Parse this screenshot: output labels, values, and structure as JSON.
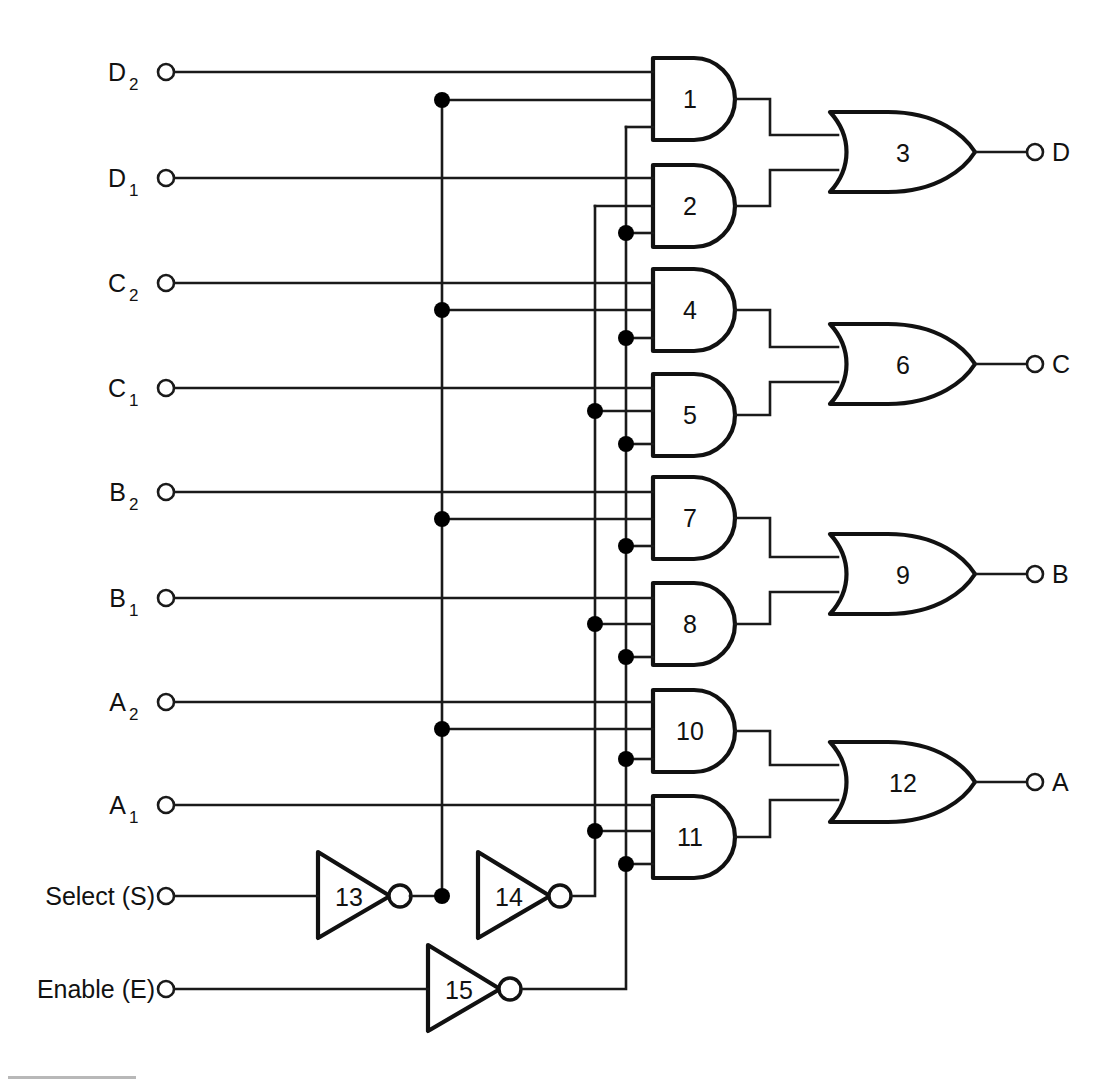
{
  "diagram": {
    "background_color": "#ffffff",
    "line_color": "#1a1a1a"
  },
  "inputs": [
    {
      "name": "input-d2",
      "base": "D",
      "sub": "2",
      "x": 165,
      "y": 72
    },
    {
      "name": "input-d1",
      "base": "D",
      "sub": "1",
      "x": 165,
      "y": 178
    },
    {
      "name": "input-c2",
      "base": "C",
      "sub": "2",
      "x": 165,
      "y": 283
    },
    {
      "name": "input-c1",
      "base": "C",
      "sub": "1",
      "x": 165,
      "y": 388
    },
    {
      "name": "input-b2",
      "base": "B",
      "sub": "2",
      "x": 165,
      "y": 492
    },
    {
      "name": "input-b1",
      "base": "B",
      "sub": "1",
      "x": 165,
      "y": 598
    },
    {
      "name": "input-a2",
      "base": "A",
      "sub": "2",
      "x": 165,
      "y": 702
    },
    {
      "name": "input-a1",
      "base": "A",
      "sub": "1",
      "x": 165,
      "y": 805
    }
  ],
  "control_inputs": [
    {
      "name": "input-select",
      "label": "Select (S)",
      "x": 165,
      "y": 896
    },
    {
      "name": "input-enable",
      "label": "Enable (E)",
      "x": 165,
      "y": 989
    }
  ],
  "outputs": [
    {
      "name": "output-d",
      "label": "D",
      "x": 1036,
      "y": 152
    },
    {
      "name": "output-c",
      "label": "C",
      "x": 1036,
      "y": 364
    },
    {
      "name": "output-b",
      "label": "B",
      "x": 1036,
      "y": 574
    },
    {
      "name": "output-a",
      "label": "A",
      "x": 1036,
      "y": 782
    }
  ],
  "and_gates": [
    {
      "name": "and-gate-1",
      "num": "1",
      "x": 653,
      "y": 58,
      "w": 82,
      "h": 82
    },
    {
      "name": "and-gate-2",
      "num": "2",
      "x": 653,
      "y": 165,
      "w": 82,
      "h": 82
    },
    {
      "name": "and-gate-4",
      "num": "4",
      "x": 653,
      "y": 269,
      "w": 82,
      "h": 82
    },
    {
      "name": "and-gate-5",
      "num": "5",
      "x": 653,
      "y": 374,
      "w": 82,
      "h": 82
    },
    {
      "name": "and-gate-7",
      "num": "7",
      "x": 653,
      "y": 477,
      "w": 82,
      "h": 82
    },
    {
      "name": "and-gate-8",
      "num": "8",
      "x": 653,
      "y": 583,
      "w": 82,
      "h": 82
    },
    {
      "name": "and-gate-10",
      "num": "10",
      "x": 653,
      "y": 690,
      "w": 82,
      "h": 82
    },
    {
      "name": "and-gate-11",
      "num": "11",
      "x": 653,
      "y": 796,
      "w": 82,
      "h": 82
    }
  ],
  "or_gates": [
    {
      "name": "or-gate-3",
      "num": "3",
      "x": 830,
      "y": 112,
      "w": 140,
      "h": 80
    },
    {
      "name": "or-gate-6",
      "num": "6",
      "x": 830,
      "y": 324,
      "w": 140,
      "h": 80
    },
    {
      "name": "or-gate-9",
      "num": "9",
      "x": 830,
      "y": 534,
      "w": 140,
      "h": 80
    },
    {
      "name": "or-gate-12",
      "num": "12",
      "x": 830,
      "y": 742,
      "w": 140,
      "h": 80
    }
  ],
  "inverters": [
    {
      "name": "inverter-13",
      "num": "13",
      "x": 318,
      "y": 852,
      "w": 72,
      "h": 86,
      "cy": 896
    },
    {
      "name": "inverter-14",
      "num": "14",
      "x": 478,
      "y": 852,
      "w": 72,
      "h": 86,
      "cy": 896
    },
    {
      "name": "inverter-15",
      "num": "15",
      "x": 428,
      "y": 945,
      "w": 72,
      "h": 86,
      "cy": 989
    }
  ],
  "buses": [
    {
      "name": "bus-s-not",
      "x": 442,
      "label": "S-bar"
    },
    {
      "name": "bus-s",
      "x": 595,
      "label": "S"
    },
    {
      "name": "bus-e-not",
      "x": 626,
      "label": "E-bar"
    }
  ],
  "junction_dots": [
    {
      "name": "junction-dot",
      "x": 442,
      "y": 100
    },
    {
      "name": "junction-dot",
      "x": 442,
      "y": 310
    },
    {
      "name": "junction-dot",
      "x": 442,
      "y": 519
    },
    {
      "name": "junction-dot",
      "x": 442,
      "y": 729
    },
    {
      "name": "junction-dot",
      "x": 442,
      "y": 896
    },
    {
      "name": "junction-dot",
      "x": 626,
      "y": 233
    },
    {
      "name": "junction-dot",
      "x": 626,
      "y": 338
    },
    {
      "name": "junction-dot",
      "x": 595,
      "y": 411
    },
    {
      "name": "junction-dot",
      "x": 626,
      "y": 444
    },
    {
      "name": "junction-dot",
      "x": 626,
      "y": 546
    },
    {
      "name": "junction-dot",
      "x": 595,
      "y": 624
    },
    {
      "name": "junction-dot",
      "x": 626,
      "y": 657
    },
    {
      "name": "junction-dot",
      "x": 626,
      "y": 759
    },
    {
      "name": "junction-dot",
      "x": 595,
      "y": 831
    },
    {
      "name": "junction-dot",
      "x": 626,
      "y": 864
    }
  ]
}
